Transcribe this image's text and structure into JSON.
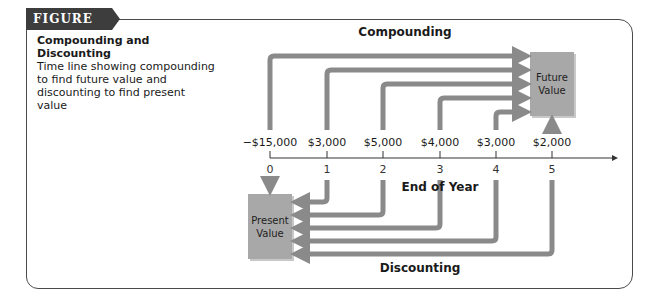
{
  "figure": {
    "label": "FIGURE 5.2",
    "title_line1": "Compounding and",
    "title_line2": "Discounting",
    "description": "Time line showing compounding to find future value and discounting to find present value"
  },
  "diagram": {
    "top_heading": "Compounding",
    "bottom_heading": "Discounting",
    "axis_label": "End of Year",
    "future_value_box": [
      "Future",
      "Value"
    ],
    "present_value_box": [
      "Present",
      "Value"
    ],
    "cash_flows": [
      "−$15,000",
      "$3,000",
      "$5,000",
      "$4,000",
      "$3,000",
      "$2,000"
    ],
    "years": [
      "0",
      "1",
      "2",
      "3",
      "4",
      "5"
    ]
  },
  "colors": {
    "arrow": "#8a8a8a",
    "box": "#a8a8a8",
    "frame": "#4a4a4a",
    "label_bg": "#3d3d3d"
  }
}
